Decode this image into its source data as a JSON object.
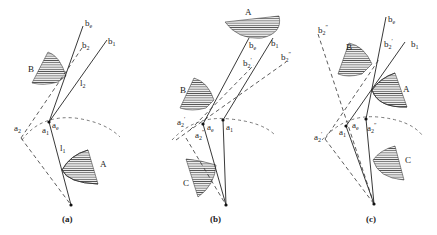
{
  "figure": {
    "panels": [
      {
        "id": "a",
        "caption": "(a)",
        "labels": {
          "b_e": "b",
          "b_e_sub": "e",
          "b_2": "b",
          "b_2_sub": "2",
          "b_1": "b",
          "b_1_sub": "1",
          "B": "B",
          "l_2": "l",
          "l_2_sub": "2",
          "a_2": "a",
          "a_2_sub": "2",
          "a_1": "a",
          "a_1_sub": "1",
          "a_e": "a",
          "a_e_sub": "e",
          "l_1": "l",
          "l_1_sub": "1",
          "A": "A"
        }
      },
      {
        "id": "b",
        "caption": "(b)",
        "labels": {
          "A": "A",
          "b_e": "b",
          "b_e_sub": "e",
          "b_1": "b",
          "b_1_sub": "1",
          "b2p": "b",
          "b2p_sub": "2",
          "b2p_sup": "′",
          "b2pp": "b",
          "b2pp_sub": "2",
          "b2pp_sup": "″",
          "B": "B",
          "a2p": "a",
          "a2p_sub": "2",
          "a2p_sup": "′",
          "a2pp": "a",
          "a2pp_sub": "2",
          "a2pp_sup": "″",
          "a_e": "a",
          "a_e_sub": "e",
          "a_1": "a",
          "a_1_sub": "1",
          "C": "C"
        }
      },
      {
        "id": "c",
        "caption": "(c)",
        "labels": {
          "b_e": "b",
          "b_e_sub": "e",
          "b2pp": "b",
          "b2pp_sub": "2",
          "b2pp_sup": "″",
          "b2p": "b",
          "b2p_sub": "2",
          "b2p_sup": "′",
          "b_1": "b",
          "b_1_sub": "1",
          "B": "B",
          "A": "A",
          "a2p": "a",
          "a2p_sub": "2",
          "a2p_sup": "′",
          "a_1": "a",
          "a_1_sub": "1",
          "a_e": "a",
          "a_e_sub": "e",
          "a2pp": "a",
          "a2pp_sub": "2",
          "a2pp_sup": "″",
          "C": "C"
        }
      }
    ]
  }
}
